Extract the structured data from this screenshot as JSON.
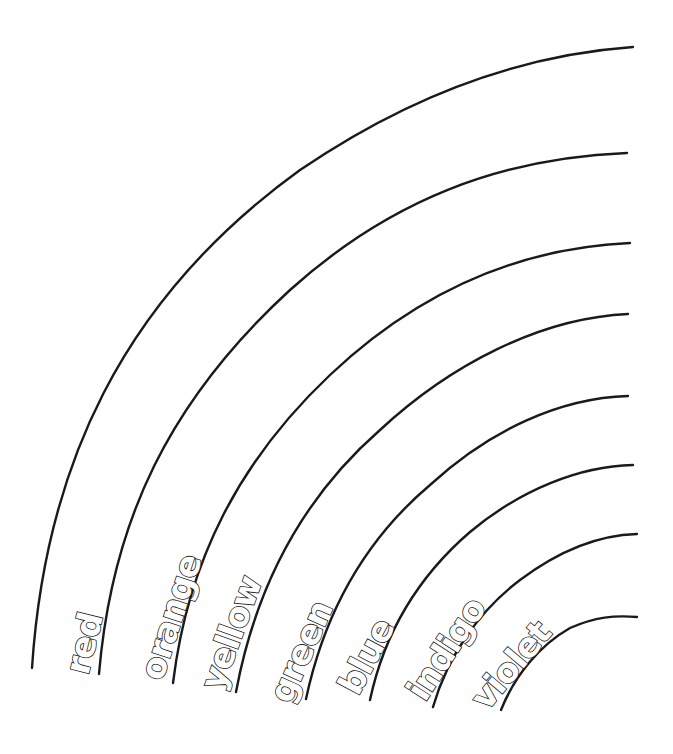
{
  "page": {
    "type": "rainbow coloring page",
    "background": "#ffffff",
    "line_color": "#1a1a1a"
  },
  "bands": [
    {
      "label": "red"
    },
    {
      "label": "orange"
    },
    {
      "label": "yellow"
    },
    {
      "label": "green"
    },
    {
      "label": "blue"
    },
    {
      "label": "indigo"
    },
    {
      "label": "violet"
    }
  ]
}
